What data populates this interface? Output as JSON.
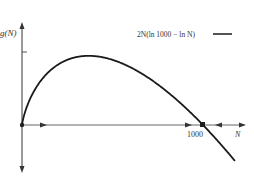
{
  "chart_data": {
    "type": "line",
    "title": "",
    "xlabel": "N",
    "ylabel": "g(N)",
    "legend": [
      {
        "label": "2N(ln 1000 − ln N)",
        "style": "solid"
      }
    ],
    "legend_position": "top-right",
    "grid": false,
    "x_tick_labels": [
      "1000"
    ],
    "xlim": [
      0,
      1200
    ],
    "series": [
      {
        "name": "2N(ln 1000 − ln N)",
        "function": "2*N*(ln(1000) - ln(N))",
        "x": [
          0,
          100,
          200,
          368,
          500,
          700,
          900,
          1000,
          1100,
          1180
        ],
        "values": [
          0,
          461,
          644,
          736,
          693,
          499,
          190,
          0,
          -210,
          -391
        ]
      }
    ],
    "annotations": [
      {
        "type": "equilibrium-point",
        "x": 0,
        "label": "unstable (arrow away)"
      },
      {
        "type": "equilibrium-point",
        "x": 1000,
        "label": "stable (arrows toward)"
      }
    ],
    "colors": {
      "curve": "#1a1a1a",
      "axis": "#555555"
    }
  },
  "labels": {
    "y_axis": "g(N)",
    "x_axis": "N",
    "x_tick": "1000",
    "legend": "2N(ln 1000 − ln N)"
  }
}
